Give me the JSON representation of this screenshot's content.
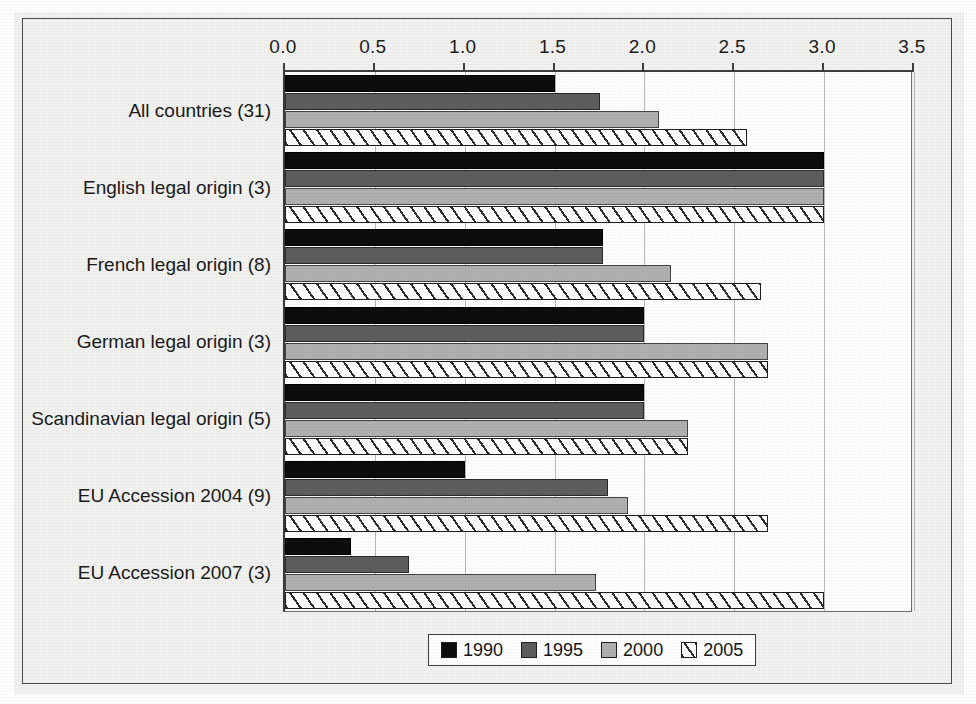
{
  "chart_data": {
    "type": "bar",
    "orientation": "horizontal",
    "title": "",
    "xlabel": "",
    "ylabel": "",
    "xlim": [
      0.0,
      3.5
    ],
    "xticks": [
      "0.0",
      "0.5",
      "1.0",
      "1.5",
      "2.0",
      "2.5",
      "3.0",
      "3.5"
    ],
    "xtick_values": [
      0.0,
      0.5,
      1.0,
      1.5,
      2.0,
      2.5,
      3.0,
      3.5
    ],
    "grid": "vertical",
    "legend_position": "bottom-center",
    "categories": [
      "All countries (31)",
      "English legal origin (3)",
      "French legal origin (8)",
      "German legal origin (3)",
      "Scandinavian legal origin (5)",
      "EU Accession 2004 (9)",
      "EU Accession 2007 (3)"
    ],
    "series": [
      {
        "name": "1990",
        "color": "#0d0d0d",
        "pattern": "solid",
        "values": [
          1.5,
          3.0,
          1.77,
          2.0,
          2.0,
          1.0,
          0.37
        ]
      },
      {
        "name": "1995",
        "color": "#5e5e5e",
        "pattern": "solid",
        "values": [
          1.75,
          3.0,
          1.77,
          2.0,
          2.0,
          1.8,
          0.69
        ]
      },
      {
        "name": "2000",
        "color": "#b0b0b0",
        "pattern": "solid",
        "values": [
          2.08,
          3.0,
          2.15,
          2.69,
          2.24,
          1.91,
          1.73
        ]
      },
      {
        "name": "2005",
        "color": "#ffffff",
        "pattern": "diagonal-hatch",
        "values": [
          2.57,
          3.0,
          2.65,
          2.69,
          2.24,
          2.69,
          3.0
        ]
      }
    ]
  },
  "legend": {
    "items": [
      {
        "label": "1990",
        "swatch": "c1990"
      },
      {
        "label": "1995",
        "swatch": "c1995"
      },
      {
        "label": "2000",
        "swatch": "c2000"
      },
      {
        "label": "2005",
        "swatch": "c2005"
      }
    ]
  },
  "colors": {
    "series_1990": "#0d0d0d",
    "series_1995": "#5e5e5e",
    "series_2000": "#b0b0b0",
    "series_2005": "#ffffff",
    "background": "#f2f2f0",
    "plot_background": "#ffffff",
    "gridline": "#b9b9b9",
    "axis": "#3d3d3d"
  }
}
